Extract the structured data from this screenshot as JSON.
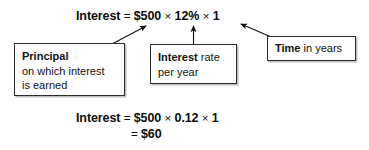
{
  "figure": {
    "ink_color": "#1a1a1a",
    "background_color": "#ffffff"
  },
  "equations": {
    "top": {
      "label": "Interest",
      "equals": "=",
      "principal": "$500",
      "times_1": "×",
      "rate": "12%",
      "times_2": "×",
      "time": "1"
    },
    "bottom_line_1": {
      "label": "Interest",
      "equals": "=",
      "principal": "$500",
      "times_1": "×",
      "rate": "0.12",
      "times_2": "×",
      "time": "1"
    },
    "bottom_line_2": {
      "equals": "=",
      "result": "$60"
    }
  },
  "callouts": [
    {
      "id": "principal",
      "bold_term": "Principal",
      "line_2": "on which interest",
      "line_3": "is earned",
      "points_to": "$500"
    },
    {
      "id": "rate",
      "bold_term": "Interest",
      "rest_of_line_1": " rate",
      "line_2": "per year",
      "points_to": "12%"
    },
    {
      "id": "time",
      "bold_term": "Time",
      "rest_of_line_1": " in years",
      "points_to": "1"
    }
  ]
}
